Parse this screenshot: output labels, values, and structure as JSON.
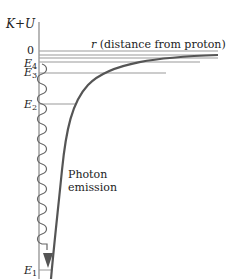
{
  "diagram": {
    "y_axis_label": "K+U",
    "x_axis_label": "r (distance from proton)",
    "x_axis_var": "r",
    "x_axis_desc": " (distance from proton)",
    "zero_label": "0",
    "levels": [
      {
        "name": "E",
        "sub": "4",
        "y": 63
      },
      {
        "name": "E",
        "sub": "3",
        "y": 73
      },
      {
        "name": "E",
        "sub": "2",
        "y": 107
      },
      {
        "name": "E",
        "sub": "1",
        "y": 270
      }
    ],
    "annotation_line1": "Photon",
    "annotation_line2": "emission",
    "colors": {
      "curve": "#555555",
      "axis": "#888888",
      "level_line": "#888888",
      "arrow": "#555555"
    }
  }
}
